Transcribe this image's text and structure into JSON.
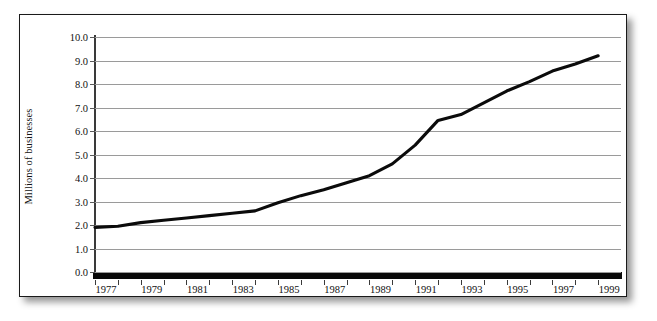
{
  "figure": {
    "background_color": "#ffffff",
    "frame_color": "#1a1a1a",
    "gridline_color": "#9a9a9a",
    "series_color": "#0b0b0b"
  },
  "chart_data": {
    "type": "line",
    "title": "",
    "xlabel": "",
    "ylabel": "Millions of businesses",
    "xlim": [
      1977,
      2000
    ],
    "ylim": [
      0.0,
      10.0
    ],
    "grid": "horizontal",
    "legend": "none",
    "ytick_labels": [
      "10.0",
      "9.0",
      "8.0",
      "7.0",
      "6.0",
      "5.0",
      "4.0",
      "3.0",
      "2.0",
      "1.0",
      "0.0"
    ],
    "ytick_values": [
      10.0,
      9.0,
      8.0,
      7.0,
      6.0,
      5.0,
      4.0,
      3.0,
      2.0,
      1.0,
      0.0
    ],
    "xtick_labels": [
      "1977",
      "1979",
      "1981",
      "1983",
      "1985",
      "1987",
      "1989",
      "1991",
      "1993",
      "1995",
      "1997",
      "1999"
    ],
    "xtick_values": [
      1977,
      1979,
      1981,
      1983,
      1985,
      1987,
      1989,
      1991,
      1993,
      1995,
      1997,
      1999
    ],
    "x": [
      1977,
      1978,
      1979,
      1980,
      1981,
      1982,
      1983,
      1984,
      1985,
      1986,
      1987,
      1988,
      1989,
      1990,
      1991,
      1992,
      1993,
      1994,
      1995,
      1996,
      1997,
      1998,
      1999
    ],
    "values": [
      1.9,
      1.95,
      2.1,
      2.2,
      2.3,
      2.4,
      2.5,
      2.6,
      2.95,
      3.25,
      3.5,
      3.8,
      4.1,
      4.6,
      5.4,
      6.45,
      6.7,
      7.2,
      7.7,
      8.1,
      8.55,
      8.85,
      9.2
    ],
    "series": [
      {
        "name": "Number of businesses",
        "values": [
          1.9,
          1.95,
          2.1,
          2.2,
          2.3,
          2.4,
          2.5,
          2.6,
          2.95,
          3.25,
          3.5,
          3.8,
          4.1,
          4.6,
          5.4,
          6.45,
          6.7,
          7.2,
          7.7,
          8.1,
          8.55,
          8.85,
          9.2
        ]
      }
    ]
  }
}
